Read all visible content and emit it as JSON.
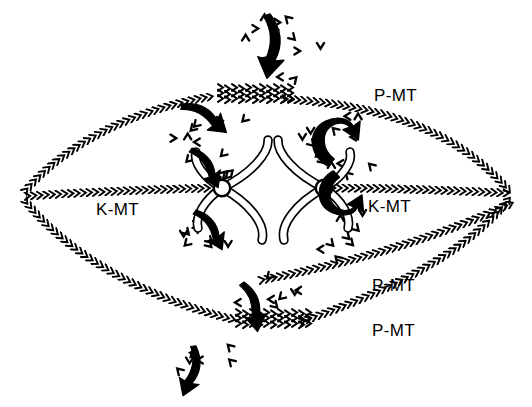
{
  "figure": {
    "background_color": "#ffffff",
    "ink_color": "#000000",
    "width": 532,
    "height": 407
  },
  "labels": [
    {
      "id": "p-mt-top-right",
      "text": "P-MT",
      "x": 374,
      "y": 86
    },
    {
      "id": "k-mt-left",
      "text": "K-MT",
      "x": 96,
      "y": 200
    },
    {
      "id": "k-mt-right",
      "text": "K-MT",
      "x": 368,
      "y": 197
    },
    {
      "id": "p-mt-bottom-upper",
      "text": "P-MT",
      "x": 372,
      "y": 276
    },
    {
      "id": "p-mt-bottom-lower",
      "text": "P-MT",
      "x": 372,
      "y": 321
    }
  ],
  "poles": [
    {
      "id": "left-pole",
      "x": 22,
      "y": 196
    },
    {
      "id": "right-pole",
      "x": 512,
      "y": 196
    }
  ],
  "chromosomes": [
    {
      "id": "left-chromosome",
      "kinetochore_x": 222,
      "kinetochore_y": 188
    },
    {
      "id": "right-chromosome",
      "kinetochore_x": 324,
      "kinetochore_y": 188
    }
  ],
  "microtubules": [
    {
      "id": "p-mt-upper-left",
      "type": "P-MT",
      "origin": "left-pole",
      "chevron": ">",
      "path": "M 26,190 C 70,140 140,108 214,96"
    },
    {
      "id": "p-mt-upper-right",
      "type": "P-MT",
      "origin": "right-pole",
      "chevron": "<",
      "path": "M 508,190 C 464,138 396,106 284,99"
    },
    {
      "id": "k-mt-left",
      "type": "K-MT",
      "origin": "left-pole",
      "chevron": ">",
      "path": "M 28,196 C 90,192 160,189 216,188"
    },
    {
      "id": "k-mt-right",
      "type": "K-MT",
      "origin": "right-pole",
      "chevron": "<",
      "path": "M 506,193 C 440,190 380,188 332,188"
    },
    {
      "id": "p-mt-lower-left",
      "type": "P-MT",
      "origin": "left-pole",
      "chevron": ">",
      "path": "M 26,202 C 72,258 150,300 236,320"
    },
    {
      "id": "p-mt-lower-right",
      "type": "P-MT",
      "origin": "right-pole",
      "chevron": "<",
      "path": "M 508,200 C 470,248 400,288 300,322"
    },
    {
      "id": "p-mt-mid-right",
      "type": "P-MT",
      "origin": "right-pole",
      "chevron": "<",
      "path": "M 510,204 C 462,226 380,258 256,281"
    }
  ],
  "overlap_zones": [
    {
      "id": "top-midzone-overlap",
      "x": 218,
      "y": 93,
      "width": 80,
      "label": "interdigitating polar MT overlap"
    },
    {
      "id": "bottom-midzone-overlap",
      "x": 236,
      "y": 318,
      "width": 80,
      "label": "interdigitating polar MT overlap"
    }
  ],
  "flux_arrows": [
    {
      "id": "arrow-top-influx",
      "kind": "curved-down",
      "x": 270,
      "y": 14
    },
    {
      "id": "arrow-upper-left-to-midzone",
      "kind": "curved-up",
      "x": 182,
      "y": 104
    },
    {
      "id": "arrow-left-chrom-up",
      "kind": "curved-up",
      "x": 192,
      "y": 148
    },
    {
      "id": "arrow-left-chrom-down",
      "kind": "curved-down",
      "x": 196,
      "y": 210
    },
    {
      "id": "arrow-right-chrom-up",
      "kind": "c-curl-up",
      "x": 324,
      "y": 128
    },
    {
      "id": "arrow-right-chrom-down",
      "kind": "c-curl-down",
      "x": 330,
      "y": 206
    },
    {
      "id": "arrow-bottom-outflux",
      "kind": "curved-down",
      "x": 244,
      "y": 282
    },
    {
      "id": "arrow-bottom-influx",
      "kind": "curved-up",
      "x": 196,
      "y": 346
    }
  ],
  "tubulin_subunits": {
    "description": "free tubulin dimer subunits drawn as small chevrons",
    "count": 68
  }
}
